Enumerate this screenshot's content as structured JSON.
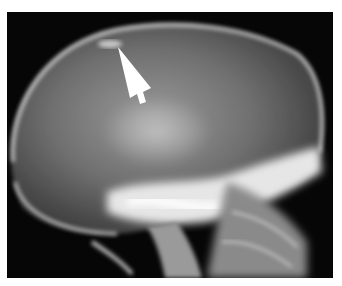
{
  "figure": {
    "type": "lateral skull radiograph",
    "annotation": {
      "kind": "arrow",
      "color": "#ffffff",
      "points_to": "calcification near the vertex of the skull"
    },
    "colors": {
      "background": "#050505",
      "bone": "#e8e8e8",
      "soft_tissue": "#7a7a7a",
      "border": "#ffffff"
    }
  }
}
